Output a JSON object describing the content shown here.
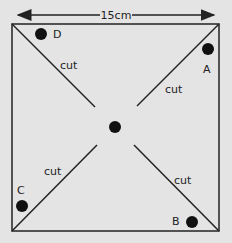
{
  "diagram": {
    "dimension_label": "15cm",
    "center_dot": true,
    "corners": {
      "top_left": "D",
      "top_right": "A",
      "bottom_left": "C",
      "bottom_right": "B"
    },
    "cut_labels": [
      "cut",
      "cut",
      "cut",
      "cut"
    ],
    "colors": {
      "background": "#e4e4e4",
      "line": "#222222",
      "dot": "#111111"
    }
  }
}
